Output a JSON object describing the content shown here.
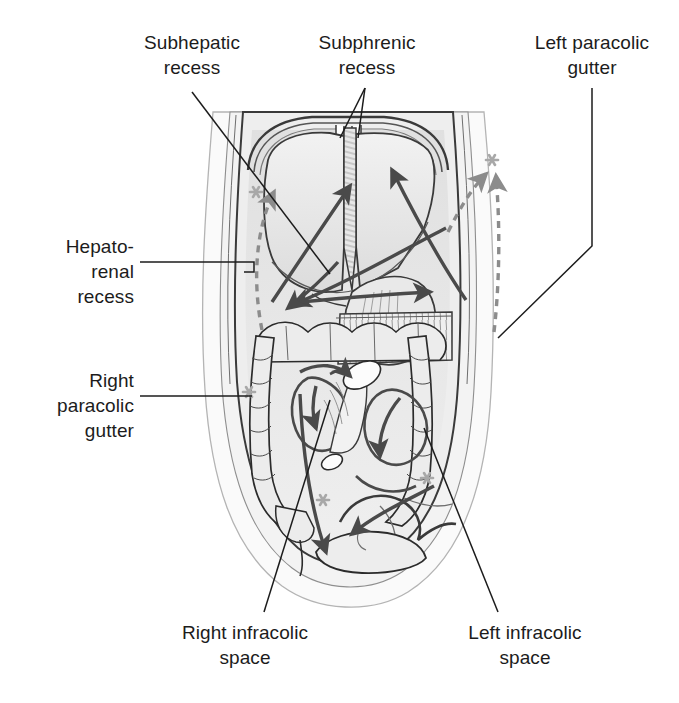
{
  "figure": {
    "view": "anterior"
  },
  "labels": {
    "subhepatic_recess": "Subhepatic\nrecess",
    "subphrenic_recess": "Subphrenic\nrecess",
    "left_paracolic_gutter": "Left paracolic\ngutter",
    "hepatorenal_recess": "Hepato-\nrenal\nrecess",
    "right_paracolic_gutter": "Right\nparacolic\ngutter",
    "right_infracolic_space": "Right infracolic\nspace",
    "left_infracolic_space": "Left infracolic\nspace"
  },
  "colors": {
    "background": "#ffffff",
    "text": "#1c1c1c",
    "leader_line": "#1c1c1c",
    "outline_dark": "#2b2b2b",
    "outline_mid": "#5a5a5a",
    "outline_light": "#9a9a9a",
    "fill_body": "#f3f3f3",
    "fill_cavity": "#e3e3e3",
    "fill_organ": "#e9e9e9",
    "fill_organ_light": "#f0f0f0",
    "fill_liver": "#e6e6e6",
    "arrow_solid": "#4a4a4a",
    "arrow_dashed": "#8c8c8c",
    "asterisk": "#a8a8a8"
  },
  "arrows": {
    "solid": [
      {
        "name": "right-subphrenic-flow",
        "from": [
          300,
          300
        ],
        "to": [
          352,
          178
        ]
      },
      {
        "name": "left-subphrenic-flow",
        "from": [
          470,
          290
        ],
        "to": [
          392,
          165
        ]
      },
      {
        "name": "right-subhepatic-to-hepatorenal",
        "from": [
          430,
          230
        ],
        "to": [
          288,
          300
        ]
      },
      {
        "name": "lesser-sac-flow",
        "from": [
          300,
          285
        ],
        "to": [
          422,
          290
        ]
      },
      {
        "name": "hepatorenal-descending",
        "from": [
          330,
          245
        ],
        "to": [
          283,
          308
        ]
      },
      {
        "name": "right-paracolic-descend",
        "from": [
          345,
          380
        ],
        "to": [
          330,
          560
        ]
      },
      {
        "name": "right-infracolic-loop",
        "from": [
          360,
          380
        ],
        "to": [
          316,
          430
        ]
      },
      {
        "name": "left-infracolic-loop",
        "from": [
          430,
          380
        ],
        "to": [
          390,
          470
        ]
      },
      {
        "name": "pelvic-inflow-left",
        "from": [
          440,
          500
        ],
        "to": [
          352,
          540
        ]
      }
    ],
    "dashed": [
      {
        "name": "right-paracolic-ascend",
        "from": [
          250,
          330
        ],
        "to": [
          272,
          190
        ]
      },
      {
        "name": "left-paracolic-ascend",
        "from": [
          498,
          330
        ],
        "to": [
          500,
          180
        ]
      },
      {
        "name": "left-subphrenic-dashed",
        "from": [
          455,
          225
        ],
        "to": [
          488,
          175
        ]
      }
    ]
  },
  "markers": {
    "asterisk_count": 5,
    "asterisk_positions": [
      [
        243,
        192
      ],
      [
        498,
        158
      ],
      [
        242,
        392
      ],
      [
        320,
        500
      ],
      [
        428,
        478
      ]
    ]
  },
  "structures": [
    "diaphragm",
    "liver-right-lobe",
    "liver-left-lobe",
    "falciform-ligament",
    "stomach",
    "greater-omentum",
    "transverse-colon",
    "ascending-colon",
    "descending-colon",
    "small-intestine",
    "mesentery-root",
    "cecum",
    "sigmoid-colon",
    "urinary-bladder",
    "abdominal-wall"
  ]
}
